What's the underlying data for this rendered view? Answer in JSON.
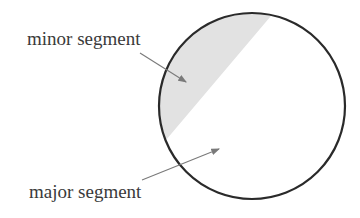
{
  "diagram": {
    "labels": {
      "minor": "minor segment",
      "major": "major segment"
    },
    "colors": {
      "circle_stroke": "#2a2a2a",
      "minor_fill": "#e2e2e2",
      "arrow": "#7a7a7a",
      "text": "#3a3a3a"
    }
  }
}
